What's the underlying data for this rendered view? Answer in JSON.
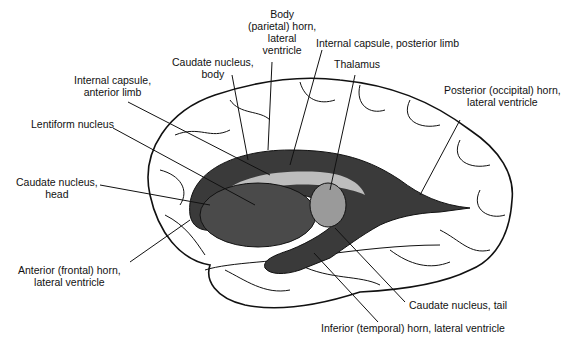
{
  "diagram": {
    "colors": {
      "background": "#ffffff",
      "outline": "#111111",
      "ventricle_fill": "#3a3a3a",
      "nucleus_fill": "#4a4a4a",
      "capsule_fill": "#bdbdbd"
    },
    "labels": {
      "body_horn": [
        "Body",
        "(parietal) horn,",
        "lateral",
        "ventricle"
      ],
      "caudate_body": [
        "Caudate nucleus,",
        "body"
      ],
      "internal_capsule_posterior": "Internal capsule, posterior limb",
      "thalamus": "Thalamus",
      "internal_capsule_anterior": [
        "Internal capsule,",
        "anterior limb"
      ],
      "posterior_horn": [
        "Posterior (occipital) horn,",
        "lateral ventricle"
      ],
      "lentiform": "Lentiform nucleus",
      "caudate_head": [
        "Caudate nucleus,",
        "head"
      ],
      "anterior_horn": [
        "Anterior (frontal) horn,",
        "lateral ventricle"
      ],
      "caudate_tail": "Caudate nucleus, tail",
      "inferior_horn": "Inferior (temporal) horn, lateral ventricle"
    }
  }
}
